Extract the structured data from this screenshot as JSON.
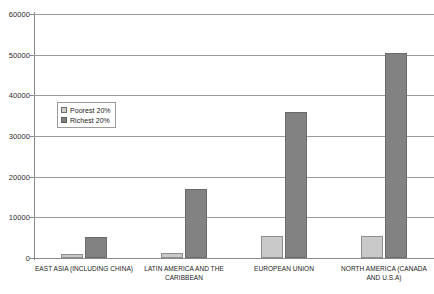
{
  "chart_data": {
    "type": "bar",
    "title": "",
    "subtitle": "",
    "xlabel": "",
    "ylabel": "",
    "ylim": [
      0,
      60000
    ],
    "ytick_interval": 10000,
    "yticks": [
      "0",
      "10000",
      "20000",
      "30000",
      "40000",
      "50000",
      "60000"
    ],
    "ytick_values": [
      0,
      10000,
      20000,
      30000,
      40000,
      50000,
      60000
    ],
    "grid": true,
    "grid_axis": "y",
    "legend_position": "inside-upper-left",
    "categories": [
      "EAST ASIA (INCLUDING CHINA)",
      "LATIN AMERICA AND THE CARIBBEAN",
      "EUROPEAN UNION",
      "NORTH AMERICA (CANADA AND U.S.A)"
    ],
    "series": [
      {
        "name": "Poorest 20%",
        "color": "#c9c9c9",
        "values": [
          1100,
          1200,
          5400,
          5400
        ]
      },
      {
        "name": "Richest 20%",
        "color": "#828282",
        "values": [
          5200,
          17000,
          35800,
          50400
        ]
      }
    ]
  },
  "legend": {
    "items": [
      {
        "label": "Poorest 20%"
      },
      {
        "label": "Richest 20%"
      }
    ]
  },
  "caption": {
    "cutoff_text": ""
  },
  "colors": {
    "poorest": "#c9c9c9",
    "richest": "#828282",
    "gridline": "#9a9a9a",
    "axis": "#888888",
    "background": "#ffffff"
  }
}
